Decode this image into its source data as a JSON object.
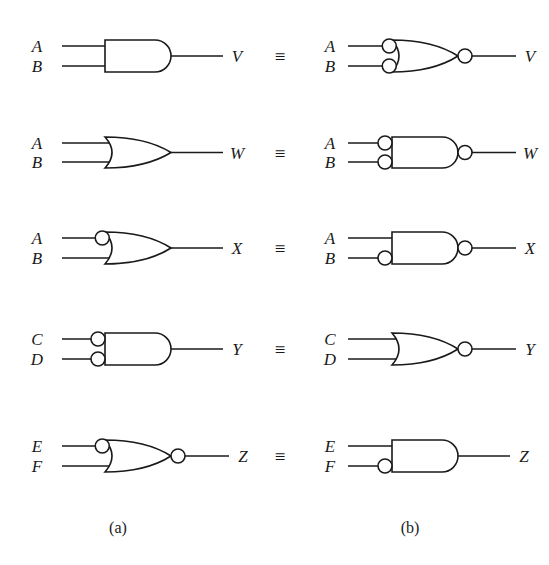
{
  "figure": {
    "equiv_symbol": "≡",
    "captions": {
      "left": "(a)",
      "right": "(b)"
    },
    "colors": {
      "ink": "#1a1a1a",
      "paper": "#ffffff"
    }
  },
  "rows": [
    {
      "id": "row-v",
      "output": "V",
      "inputs": [
        "A",
        "B"
      ],
      "left": {
        "gate_type": "AND",
        "input_bubbles": [
          false,
          false
        ],
        "output_bubble": false,
        "input_labels": [
          "A",
          "B"
        ],
        "output_label": "V"
      },
      "right": {
        "gate_type": "OR",
        "input_bubbles": [
          true,
          true
        ],
        "output_bubble": true,
        "input_labels": [
          "A",
          "B"
        ],
        "output_label": "V"
      }
    },
    {
      "id": "row-w",
      "output": "W",
      "inputs": [
        "A",
        "B"
      ],
      "left": {
        "gate_type": "OR",
        "input_bubbles": [
          false,
          false
        ],
        "output_bubble": false,
        "input_labels": [
          "A",
          "B"
        ],
        "output_label": "W"
      },
      "right": {
        "gate_type": "AND",
        "input_bubbles": [
          true,
          true
        ],
        "output_bubble": true,
        "input_labels": [
          "A",
          "B"
        ],
        "output_label": "W"
      }
    },
    {
      "id": "row-x",
      "output": "X",
      "inputs": [
        "A",
        "B"
      ],
      "left": {
        "gate_type": "OR",
        "input_bubbles": [
          true,
          false
        ],
        "output_bubble": false,
        "input_labels": [
          "A",
          "B"
        ],
        "output_label": "X"
      },
      "right": {
        "gate_type": "AND",
        "input_bubbles": [
          false,
          true
        ],
        "output_bubble": true,
        "input_labels": [
          "A",
          "B"
        ],
        "output_label": "X"
      }
    },
    {
      "id": "row-y",
      "output": "Y",
      "inputs": [
        "C",
        "D"
      ],
      "left": {
        "gate_type": "AND",
        "input_bubbles": [
          true,
          true
        ],
        "output_bubble": false,
        "input_labels": [
          "C",
          "D"
        ],
        "output_label": "Y"
      },
      "right": {
        "gate_type": "OR",
        "input_bubbles": [
          false,
          false
        ],
        "output_bubble": true,
        "input_labels": [
          "C",
          "D"
        ],
        "output_label": "Y"
      }
    },
    {
      "id": "row-z",
      "output": "Z",
      "inputs": [
        "E",
        "F"
      ],
      "left": {
        "gate_type": "OR",
        "input_bubbles": [
          true,
          false
        ],
        "output_bubble": true,
        "input_labels": [
          "E",
          "F"
        ],
        "output_label": "Z"
      },
      "right": {
        "gate_type": "AND",
        "input_bubbles": [
          false,
          true
        ],
        "output_bubble": false,
        "input_labels": [
          "E",
          "F"
        ],
        "output_label": "Z"
      }
    }
  ],
  "geometry": {
    "row_top_y": [
      40,
      137,
      232,
      333,
      440
    ],
    "row_bot_y": [
      72,
      168,
      264,
      365,
      472
    ],
    "left_label_x": 37,
    "right_label_x": 330,
    "left_gate_x": 105,
    "right_gate_x": 392,
    "gate_width": 66,
    "equiv_x": 280,
    "caption_y": 533,
    "caption_left_x": 118,
    "caption_right_x": 410
  }
}
